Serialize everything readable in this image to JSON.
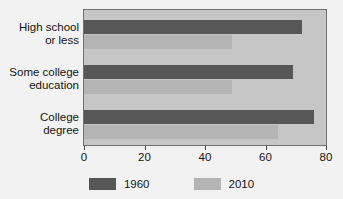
{
  "chart_data": {
    "type": "bar",
    "orientation": "horizontal",
    "title": "",
    "xlabel": "",
    "ylabel": "",
    "categories": [
      "High school\nor less",
      "Some college\neducation",
      "College\ndegree"
    ],
    "category_lines": [
      [
        "High school",
        "or less"
      ],
      [
        "Some college",
        "education"
      ],
      [
        "College",
        "degree"
      ]
    ],
    "series": [
      {
        "name": "1960",
        "color": "#575757",
        "values": [
          72,
          69,
          76
        ]
      },
      {
        "name": "2010",
        "color": "#b4b4b4",
        "values": [
          49,
          49,
          64
        ]
      }
    ],
    "xlim": [
      0,
      80
    ],
    "xticks": [
      0,
      20,
      40,
      60,
      80
    ],
    "xtick_labels": [
      "0",
      "20",
      "40",
      "60",
      "80"
    ],
    "grid": false,
    "legend_position": "bottom",
    "plot_background": "#c6c6c6",
    "figure_background": "#f2f2f2",
    "frame_color": "#6f6f6f",
    "text_color": "#141414"
  }
}
